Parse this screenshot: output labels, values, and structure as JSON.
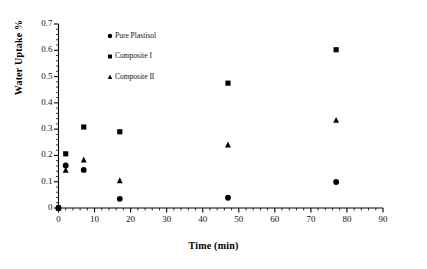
{
  "chart_data": {
    "type": "scatter",
    "title": "",
    "xlabel": "Time (min)",
    "ylabel": "Water Uptake %",
    "xlim": [
      0,
      90
    ],
    "ylim": [
      0,
      0.7
    ],
    "xticks": [
      "0",
      "10",
      "20",
      "30",
      "40",
      "50",
      "60",
      "70",
      "80",
      "90"
    ],
    "xtick_values": [
      0,
      10,
      20,
      30,
      40,
      50,
      60,
      70,
      80,
      90
    ],
    "yticks": [
      "0",
      "0.1",
      "0.2",
      "0.3",
      "0.4",
      "0.5",
      "0.6",
      "0.7"
    ],
    "ytick_values": [
      0,
      0.1,
      0.2,
      0.3,
      0.4,
      0.5,
      0.6,
      0.7
    ],
    "x_minor_step": 2,
    "y_minor_step": 0.02,
    "grid": false,
    "legend_position": "upper-left-inside",
    "marker_color": "#000000",
    "axis_color": "#000000",
    "series": [
      {
        "name": "Pure Plastisol",
        "marker": "circle",
        "points": [
          {
            "x": 0,
            "y": 0.0
          },
          {
            "x": 2,
            "y": 0.162
          },
          {
            "x": 7,
            "y": 0.145
          },
          {
            "x": 17,
            "y": 0.035
          },
          {
            "x": 47,
            "y": 0.039
          },
          {
            "x": 77,
            "y": 0.099
          }
        ]
      },
      {
        "name": "Composite I",
        "marker": "square",
        "points": [
          {
            "x": 0,
            "y": 0.0
          },
          {
            "x": 2,
            "y": 0.206
          },
          {
            "x": 7,
            "y": 0.308
          },
          {
            "x": 17,
            "y": 0.29
          },
          {
            "x": 47,
            "y": 0.475
          },
          {
            "x": 77,
            "y": 0.602
          }
        ]
      },
      {
        "name": "Composite II",
        "marker": "triangle",
        "points": [
          {
            "x": 0,
            "y": 0.0
          },
          {
            "x": 2,
            "y": 0.144
          },
          {
            "x": 7,
            "y": 0.183
          },
          {
            "x": 17,
            "y": 0.104
          },
          {
            "x": 47,
            "y": 0.24
          },
          {
            "x": 77,
            "y": 0.334
          }
        ]
      }
    ]
  },
  "legend": {
    "items": [
      {
        "label": "Pure Plastisol",
        "marker": "circle"
      },
      {
        "label": "Composite I",
        "marker": "square"
      },
      {
        "label": "Composite II",
        "marker": "triangle"
      }
    ]
  }
}
